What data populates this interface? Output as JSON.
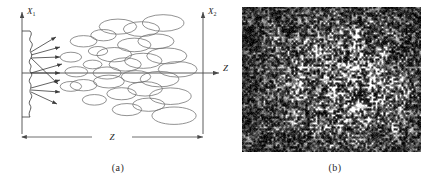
{
  "figure": {
    "panels": [
      {
        "id": "a",
        "caption": "(a)",
        "type": "schematic-diagram",
        "description": "Schematic of speckle formation: coherent light scattered from a rough surface plane X1 propagates a distance Z and forms speckles of growing size at observation plane X2",
        "labels": {
          "axis_x1": "X",
          "axis_x1_sub": "1",
          "axis_x2": "X",
          "axis_x2_sub": "2",
          "axis_z": "Z",
          "distance_z": "Z"
        }
      },
      {
        "id": "b",
        "caption": "(b)",
        "type": "photograph",
        "description": "Grayscale photograph of a laser speckle pattern, bright granular speckles on a dark background with a brighter diffuse region toward the centre-right"
      }
    ]
  },
  "chart_data": {
    "type": "scatter",
    "title": "",
    "subtitle": "",
    "xlabel": "Z",
    "ylabel": "X",
    "grid": false,
    "legend_position": "none",
    "xlim": [
      0,
      100
    ],
    "ylim": [
      -50,
      50
    ],
    "annotations": [
      {
        "text": "X1",
        "x": 3,
        "y": 48,
        "role": "scattering-plane-axis-label"
      },
      {
        "text": "X2",
        "x": 97,
        "y": 48,
        "role": "observation-plane-axis-label"
      },
      {
        "text": "Z",
        "x": 99,
        "y": 0,
        "role": "propagation-axis-label"
      },
      {
        "text": "Z",
        "x": 50,
        "y": -40,
        "role": "distance-dimension-label"
      }
    ],
    "series": [
      {
        "name": "scattered-rays",
        "type": "arrows",
        "values": [
          {
            "x0": 5,
            "y0": 26,
            "x1": 24,
            "y1": 39
          },
          {
            "x0": 5,
            "y0": 20,
            "x1": 26,
            "y1": 28
          },
          {
            "x0": 5,
            "y0": 12,
            "x1": 26,
            "y1": 18
          },
          {
            "x0": 5,
            "y0": 4,
            "x1": 27,
            "y1": 8
          },
          {
            "x0": 5,
            "y0": 0,
            "x1": 22,
            "y1": 0
          },
          {
            "x0": 5,
            "y0": 4,
            "x1": 25,
            "y1": -12
          },
          {
            "x0": 5,
            "y0": -4,
            "x1": 26,
            "y1": -6
          },
          {
            "x0": 5,
            "y0": -10,
            "x1": 26,
            "y1": -16
          },
          {
            "x0": 5,
            "y0": -18,
            "x1": 25,
            "y1": -26
          }
        ]
      },
      {
        "name": "speckle-cells",
        "type": "ellipses",
        "comment": "x,y = centre in axis units; rx,ry = semi-axes. Cell size grows with propagation distance Z.",
        "values": [
          {
            "x": 27,
            "y": 13,
            "rx": 3.2,
            "ry": 2.6
          },
          {
            "x": 34,
            "y": 26,
            "rx": 4.0,
            "ry": 3.0
          },
          {
            "x": 30,
            "y": 1,
            "rx": 3.4,
            "ry": 2.7
          },
          {
            "x": 27,
            "y": -11,
            "rx": 3.2,
            "ry": 2.6
          },
          {
            "x": 34,
            "y": -10,
            "rx": 4.0,
            "ry": 3.0
          },
          {
            "x": 39,
            "y": 7,
            "rx": 2.8,
            "ry": 2.3
          },
          {
            "x": 42,
            "y": 18,
            "rx": 2.9,
            "ry": 2.4
          },
          {
            "x": 40,
            "y": -22,
            "rx": 3.6,
            "ry": 2.8
          },
          {
            "x": 45,
            "y": 31,
            "rx": 3.8,
            "ry": 3.0
          },
          {
            "x": 47,
            "y": 0,
            "rx": 4.2,
            "ry": 3.2
          },
          {
            "x": 48,
            "y": -7,
            "rx": 4.6,
            "ry": 3.4
          },
          {
            "x": 51,
            "y": 15,
            "rx": 5.2,
            "ry": 3.8
          },
          {
            "x": 53,
            "y": 38,
            "rx": 5.6,
            "ry": 4.0
          },
          {
            "x": 55,
            "y": -17,
            "rx": 4.4,
            "ry": 3.2
          },
          {
            "x": 57,
            "y": 7,
            "rx": 4.8,
            "ry": 3.5
          },
          {
            "x": 58,
            "y": -30,
            "rx": 4.4,
            "ry": 3.2
          },
          {
            "x": 62,
            "y": 23,
            "rx": 5.0,
            "ry": 3.6
          },
          {
            "x": 63,
            "y": -3,
            "rx": 4.4,
            "ry": 3.2
          },
          {
            "x": 66,
            "y": 36,
            "rx": 5.4,
            "ry": 3.9
          },
          {
            "x": 67,
            "y": 10,
            "rx": 5.6,
            "ry": 4.0
          },
          {
            "x": 68,
            "y": -13,
            "rx": 5.2,
            "ry": 3.8
          },
          {
            "x": 70,
            "y": -26,
            "rx": 4.8,
            "ry": 3.5
          },
          {
            "x": 74,
            "y": 26,
            "rx": 5.4,
            "ry": 3.9
          },
          {
            "x": 76,
            "y": -5,
            "rx": 5.8,
            "ry": 4.1
          },
          {
            "x": 78,
            "y": 41,
            "rx": 6.2,
            "ry": 4.4
          },
          {
            "x": 80,
            "y": 14,
            "rx": 6.0,
            "ry": 4.2
          },
          {
            "x": 82,
            "y": -19,
            "rx": 6.2,
            "ry": 4.4
          },
          {
            "x": 84,
            "y": -35,
            "rx": 6.6,
            "ry": 4.6
          },
          {
            "x": 86,
            "y": 3,
            "rx": 5.8,
            "ry": 4.1
          }
        ]
      }
    ]
  },
  "colors": {
    "line": "#3b3b3b",
    "axis": "#4a4a4a",
    "ellipse_stroke": "#6e6e6e",
    "photo_dark": "#0b0b0b",
    "photo_light": "#f2f2f2",
    "background": "#ffffff",
    "caption_text": "#2a2a2a"
  }
}
